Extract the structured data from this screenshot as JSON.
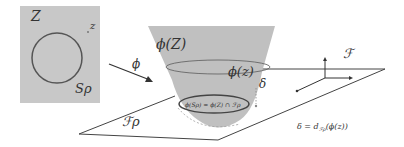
{
  "diagram": {
    "latent_space": {
      "label": "Z",
      "point_label": "z",
      "sphere_label": "Sρ",
      "fill_color": "#c8c8c8"
    },
    "mapping": {
      "label": "ϕ"
    },
    "manifold": {
      "label": "ϕ(Z)",
      "point_label": "ϕ(z)",
      "intersection_label": "ϕ(Sρ) = ϕ(Z) ∩ ℱρ",
      "fill_color": "#bdbdbd"
    },
    "plane": {
      "label": "ℱρ"
    },
    "feature_space": {
      "label": "ℱ"
    },
    "distance": {
      "label": "δ",
      "formula_lhs": "δ = d",
      "formula_sub": "ℱρ",
      "formula_rhs": "(ϕ(z))"
    }
  }
}
